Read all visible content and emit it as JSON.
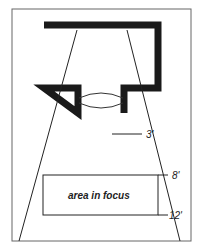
{
  "diagram": {
    "labels": {
      "area": "area in focus",
      "near_mark": "3'",
      "focus_near": "8'",
      "focus_far": "12'"
    },
    "colors": {
      "ink": "#1a1a1a",
      "frame": "#555555",
      "background": "#ffffff"
    }
  }
}
